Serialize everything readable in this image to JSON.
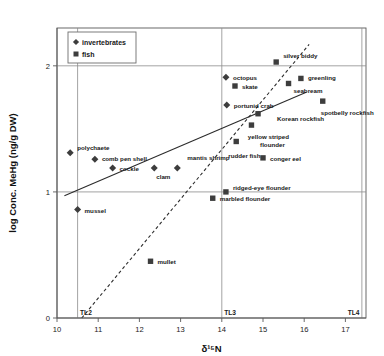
{
  "chart_data": {
    "type": "scatter",
    "title": "",
    "xlabel": "δ¹⁵N",
    "ylabel": "log Conc. MeHg (ng/g DW)",
    "xlim": [
      10,
      17.5
    ],
    "ylim": [
      0,
      2.3
    ],
    "xticks": [
      10,
      11,
      12,
      13,
      14,
      15,
      16,
      17
    ],
    "yticks": [
      0,
      1,
      2
    ],
    "grid": "horizontal gridlines at y=1 and y=2; vertical trophic-level lines at x=10.5, 14.0, 17.4",
    "legend_position": "top-left inside plot",
    "legend": [
      {
        "name": "invertebrates",
        "marker": "diamond"
      },
      {
        "name": "fish",
        "marker": "square"
      }
    ],
    "trophic_levels": [
      {
        "label": "TL2",
        "x": 10.5
      },
      {
        "label": "TL3",
        "x": 14.0
      },
      {
        "label": "TL4",
        "x": 17.4
      }
    ],
    "series": [
      {
        "name": "invertebrates",
        "marker": "diamond",
        "points": [
          {
            "label": "polychaete",
            "x": 10.32,
            "y": 1.31,
            "label_dx": 7,
            "label_dy": -3
          },
          {
            "label": "comb pen shell",
            "x": 10.92,
            "y": 1.26,
            "label_dx": 7,
            "label_dy": 2
          },
          {
            "label": "cockle",
            "x": 11.35,
            "y": 1.19,
            "label_dx": 7,
            "label_dy": 3
          },
          {
            "label": "clam",
            "x": 12.36,
            "y": 1.19,
            "label_dx": 2,
            "label_dy": 11
          },
          {
            "label": "mantis shrimp",
            "x": 12.92,
            "y": 1.19,
            "label_dx": 10,
            "label_dy": -8
          },
          {
            "label": "mussel",
            "x": 10.5,
            "y": 0.86,
            "label_dx": 7,
            "label_dy": 3
          },
          {
            "label": "octopus",
            "x": 14.1,
            "y": 1.91,
            "label_dx": 7,
            "label_dy": 3
          },
          {
            "label": "portunid crab",
            "x": 14.12,
            "y": 1.69,
            "label_dx": 7,
            "label_dy": 3
          }
        ]
      },
      {
        "name": "fish",
        "marker": "square",
        "points": [
          {
            "label": "mullet",
            "x": 12.27,
            "y": 0.45,
            "label_dx": 7,
            "label_dy": 3
          },
          {
            "label": "marbled flounder",
            "x": 13.78,
            "y": 0.95,
            "label_dx": 7,
            "label_dy": 3
          },
          {
            "label": "ridged-eye flounder",
            "x": 14.1,
            "y": 1.0,
            "label_dx": 7,
            "label_dy": -2
          },
          {
            "label": "rudder fish",
            "x": 14.35,
            "y": 1.4,
            "label_dx": -8,
            "label_dy": 17
          },
          {
            "label": "skate",
            "x": 14.32,
            "y": 1.84,
            "label_dx": 7,
            "label_dy": 3
          },
          {
            "label": "yellow striped flounder",
            "x": 14.72,
            "y": 1.53,
            "label_dx": 17,
            "label_dy": 14
          },
          {
            "label": "Korean rockfish",
            "x": 14.88,
            "y": 1.62,
            "label_dx": 19,
            "label_dy": 7
          },
          {
            "label": "conger eel",
            "x": 15.0,
            "y": 1.27,
            "label_dx": 7,
            "label_dy": 3
          },
          {
            "label": "silver biddy",
            "x": 15.32,
            "y": 2.03,
            "label_dx": 7,
            "label_dy": -4
          },
          {
            "label": "seabream",
            "x": 15.62,
            "y": 1.86,
            "label_dx": 5,
            "label_dy": 10
          },
          {
            "label": "greenling",
            "x": 15.92,
            "y": 1.9,
            "label_dx": 7,
            "label_dy": 2
          },
          {
            "label": "spotbelly rockfish",
            "x": 16.45,
            "y": 1.72,
            "label_dx": -2,
            "label_dy": 14
          }
        ]
      }
    ],
    "lines": [
      {
        "name": "solid-regression-line",
        "style": "solid",
        "x1": 10.18,
        "y1": 0.97,
        "x2": 16.05,
        "y2": 1.79
      },
      {
        "name": "dashed-regression-line",
        "style": "dashed",
        "x1": 10.6,
        "y1": 0.0,
        "x2": 16.12,
        "y2": 2.17
      }
    ]
  }
}
